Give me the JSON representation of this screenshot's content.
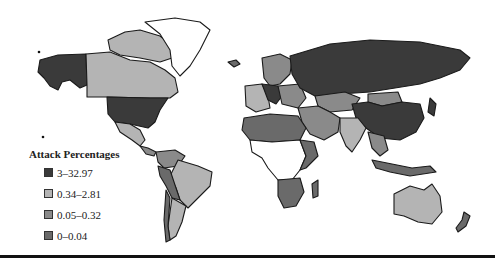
{
  "figure": {
    "type": "choropleth-world-map",
    "background": "#ffffff",
    "border_color": "#1a1a1a"
  },
  "legend": {
    "title": "Attack Percentages",
    "items": [
      {
        "label": "3–32.97",
        "color": "#3a3a3a"
      },
      {
        "label": "0.34–2.81",
        "color": "#b4b4b4"
      },
      {
        "label": "0.05–0.32",
        "color": "#8a8a8a"
      },
      {
        "label": "0–0.04",
        "color": "#6a6a6a"
      }
    ],
    "no_data_color": "#ffffff"
  },
  "regions": [
    {
      "name": "Alaska",
      "category": 0
    },
    {
      "name": "Canada",
      "category": 1
    },
    {
      "name": "Canadian Arctic Islands",
      "category": 1
    },
    {
      "name": "Greenland",
      "category": -1
    },
    {
      "name": "United States",
      "category": 0
    },
    {
      "name": "Mexico",
      "category": 1
    },
    {
      "name": "Central America",
      "category": 2
    },
    {
      "name": "Brazil",
      "category": 1
    },
    {
      "name": "Argentina",
      "category": 1
    },
    {
      "name": "Chile",
      "category": 3
    },
    {
      "name": "Peru / Bolivia",
      "category": 3
    },
    {
      "name": "Venezuela / Colombia",
      "category": 2
    },
    {
      "name": "Scandinavia",
      "category": 2
    },
    {
      "name": "Western Europe",
      "category": 1
    },
    {
      "name": "Central Europe",
      "category": 0
    },
    {
      "name": "Eastern Europe",
      "category": 2
    },
    {
      "name": "Russia",
      "category": 0
    },
    {
      "name": "Kazakhstan",
      "category": 2
    },
    {
      "name": "Mongolia",
      "category": 2
    },
    {
      "name": "China",
      "category": 0
    },
    {
      "name": "Japan",
      "category": 0
    },
    {
      "name": "Middle East",
      "category": 2
    },
    {
      "name": "India",
      "category": 1
    },
    {
      "name": "Southeast Asia",
      "category": 2
    },
    {
      "name": "Indonesia",
      "category": 3
    },
    {
      "name": "North Africa",
      "category": 3
    },
    {
      "name": "Central Africa",
      "category": -1
    },
    {
      "name": "East Africa",
      "category": 3
    },
    {
      "name": "Southern Africa",
      "category": 3
    },
    {
      "name": "Madagascar",
      "category": 3
    },
    {
      "name": "Australia",
      "category": 1
    },
    {
      "name": "New Zealand",
      "category": 3
    },
    {
      "name": "Iceland",
      "category": 3
    }
  ]
}
